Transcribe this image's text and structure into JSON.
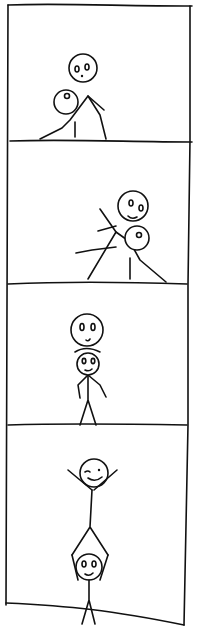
{
  "comic": {
    "panel_count": 4,
    "colors": {
      "ink": "#111111",
      "paper": "#ffffff"
    },
    "panels": [
      {
        "index": 1,
        "description": "One stick figure leans over another that is crouched/kneeling on the ground"
      },
      {
        "index": 2,
        "description": "Figures tilted; one tumbling over the other"
      },
      {
        "index": 3,
        "description": "One figure's head stacked on top of another standing figure's head"
      },
      {
        "index": 4,
        "description": "Acrobatic pose: one figure held upside-down above the other, arms raised in celebration"
      }
    ]
  }
}
